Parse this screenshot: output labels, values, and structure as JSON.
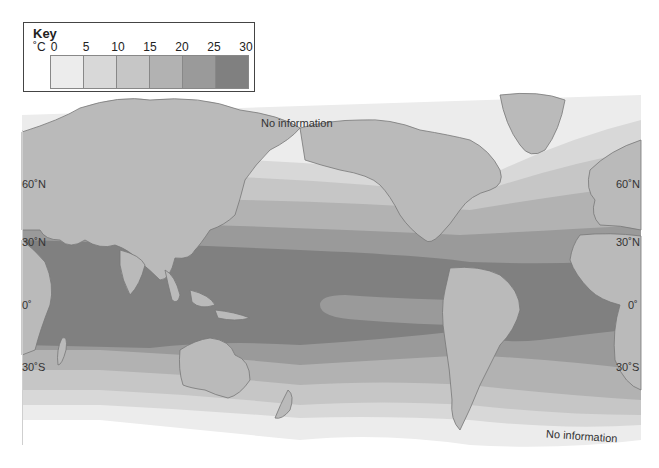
{
  "key": {
    "title": "Key",
    "unit": "˚C",
    "ticks": [
      "0",
      "5",
      "10",
      "15",
      "20",
      "25",
      "30"
    ],
    "bands": [
      {
        "range": "0-5",
        "color": "#ececec"
      },
      {
        "range": "5-10",
        "color": "#d8d8d8"
      },
      {
        "range": "10-15",
        "color": "#c6c6c6"
      },
      {
        "range": "15-20",
        "color": "#b2b2b2"
      },
      {
        "range": "20-25",
        "color": "#9a9a9a"
      },
      {
        "range": "25-30",
        "color": "#808080"
      }
    ]
  },
  "map": {
    "land_color": "#bababa",
    "coast_color": "#777777",
    "labels": {
      "no_info_north": "No information",
      "no_info_south": "No information"
    },
    "latitudes_left": [
      "60˚N",
      "30˚N",
      "0˚",
      "30˚S"
    ],
    "latitudes_right": [
      "60˚N",
      "30˚N",
      "0˚",
      "30˚S"
    ]
  }
}
